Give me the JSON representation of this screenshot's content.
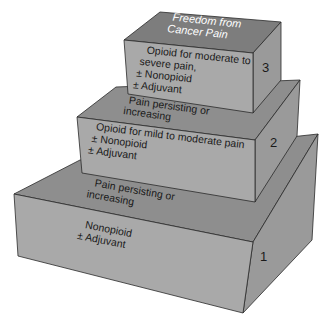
{
  "diagram": {
    "type": "stepped-pyramid",
    "colors": {
      "front": "#a9a9a9",
      "top": "#8e8e8e",
      "cap_top": "#7d7d7d",
      "side": "#9a9a9a",
      "outline": "#2a2a2a",
      "cap_text": "#ffffff"
    },
    "goal": {
      "line1": "Freedom from",
      "line2": "Cancer Pain"
    },
    "steps": [
      {
        "number": "1",
        "lines": [
          "Nonopioid",
          "± Adjuvant"
        ]
      },
      {
        "number": "2",
        "lines": [
          "Opioid for mild to moderate pain",
          "± Nonopioid",
          "± Adjuvant"
        ]
      },
      {
        "number": "3",
        "lines": [
          "Opioid for moderate to",
          "severe pain,",
          "± Nonopioid",
          "± Adjuvant"
        ]
      }
    ],
    "transitions": [
      {
        "between": "1-2",
        "line1": "Pain persisting or",
        "line2": "increasing"
      },
      {
        "between": "2-3",
        "line1": "Pain persisting or",
        "line2": "increasing"
      }
    ]
  }
}
